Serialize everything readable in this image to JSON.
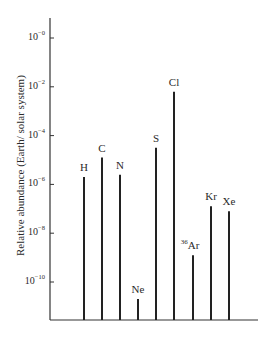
{
  "chart_data": {
    "type": "bar",
    "title": "",
    "xlabel": "",
    "ylabel": "Relative abundance (Earth/ solar system)",
    "yscale": "log",
    "ylim_exponent": [
      -12,
      0
    ],
    "y_ticks": [
      {
        "base": "10",
        "exp": "−0",
        "value_exp": 0
      },
      {
        "base": "10",
        "exp": "−2",
        "value_exp": -2
      },
      {
        "base": "10",
        "exp": "−4",
        "value_exp": -4
      },
      {
        "base": "10",
        "exp": "−6",
        "value_exp": -6
      },
      {
        "base": "10",
        "exp": "−8",
        "value_exp": -8
      },
      {
        "base": "10",
        "exp": "−10",
        "value_exp": -10
      }
    ],
    "categories": [
      "H",
      "C",
      "N",
      "Ne",
      "S",
      "Cl",
      "36Ar",
      "Kr",
      "Xe"
    ],
    "category_labels": [
      {
        "pre": "",
        "text": "H"
      },
      {
        "pre": "",
        "text": "C"
      },
      {
        "pre": "",
        "text": "N"
      },
      {
        "pre": "",
        "text": "Ne"
      },
      {
        "pre": "",
        "text": "S"
      },
      {
        "pre": "",
        "text": "Cl"
      },
      {
        "pre": "36",
        "text": "Ar"
      },
      {
        "pre": "",
        "text": "Kr"
      },
      {
        "pre": "",
        "text": "Xe"
      }
    ],
    "log10_values": [
      -5.7,
      -4.9,
      -5.6,
      -10.7,
      -4.5,
      -2.2,
      -8.9,
      -6.9,
      -7.1
    ],
    "grid": false,
    "legend": null
  }
}
